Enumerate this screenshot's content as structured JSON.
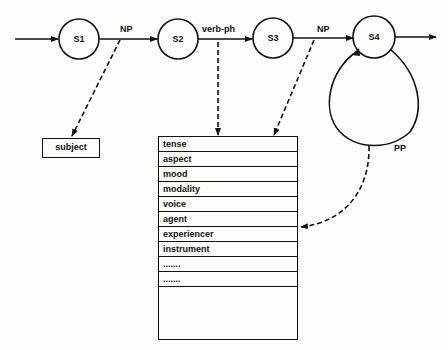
{
  "diagram": {
    "type": "augmented transition network with case frame",
    "states": [
      {
        "id": "S1",
        "label": "S1"
      },
      {
        "id": "S2",
        "label": "S2"
      },
      {
        "id": "S3",
        "label": "S3"
      },
      {
        "id": "S4",
        "label": "S4"
      }
    ],
    "arcs": [
      {
        "from": "start",
        "to": "S1",
        "label": ""
      },
      {
        "from": "S1",
        "to": "S2",
        "label": "NP"
      },
      {
        "from": "S2",
        "to": "S3",
        "label": "verb-ph"
      },
      {
        "from": "S3",
        "to": "S4",
        "label": "NP"
      },
      {
        "from": "S4",
        "to": "S4",
        "label": "PP"
      },
      {
        "from": "S4",
        "to": "exit",
        "label": ""
      }
    ],
    "subject_box": {
      "label": "subject"
    },
    "frame_slots": [
      "tense",
      "aspect",
      "mood",
      "modality",
      "voice",
      "agent",
      "experiencer",
      "instrument",
      ".......",
      "......."
    ],
    "dashed_links": [
      {
        "from_arc": "NP (S1-S2)",
        "to": "subject"
      },
      {
        "from_arc": "verb-ph",
        "to": "tense"
      },
      {
        "from_arc": "NP (S3-S4)",
        "to": "frame-top"
      },
      {
        "from_arc": "PP",
        "to": "agent"
      }
    ]
  }
}
